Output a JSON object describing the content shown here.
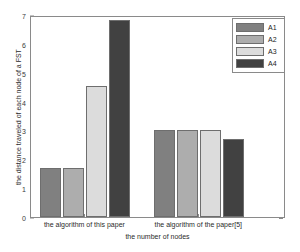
{
  "chart_data": {
    "type": "bar",
    "title": "",
    "xlabel": "the number of nodes",
    "ylabel": "the distance traveled of each node of a FST",
    "categories": [
      "the algorithm of this paper",
      "the algorithm of the paper[5]"
    ],
    "series": [
      {
        "name": "A1",
        "values": [
          1.72,
          3.05
        ],
        "color": "#808080"
      },
      {
        "name": "A2",
        "values": [
          1.72,
          3.06
        ],
        "color": "#adadad"
      },
      {
        "name": "A3",
        "values": [
          4.6,
          3.06
        ],
        "color": "#dcdcdc"
      },
      {
        "name": "A4",
        "values": [
          6.9,
          2.72
        ],
        "color": "#414141"
      }
    ],
    "ylim": [
      0,
      7
    ],
    "yticks": [
      0,
      1,
      2,
      3,
      4,
      5,
      6,
      7
    ],
    "ytick_labels": [
      "0",
      "1",
      "2",
      "3",
      "4",
      "5",
      "6",
      "7"
    ],
    "grid": false,
    "legend_position": "top-right",
    "legend_entries": [
      "A1",
      "A2",
      "A3",
      "A4"
    ]
  },
  "axes": {
    "frame_color": "#8a8a8a",
    "tick_color": "#3a3a3a"
  }
}
